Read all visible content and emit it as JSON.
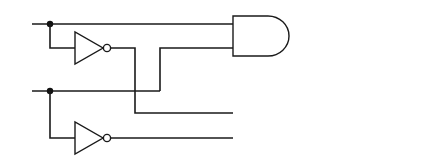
{
  "diagram": {
    "type": "logic-circuit",
    "inputs": [
      {
        "name": "x",
        "label": "x"
      },
      {
        "name": "y",
        "label": "y"
      }
    ],
    "inverters": [
      {
        "input": "x",
        "output_label": "x′"
      },
      {
        "input": "y",
        "output_label": "y′"
      }
    ],
    "and_gates": [
      {
        "inputs": [
          "x",
          "y"
        ],
        "input_labels": [
          "x",
          "y"
        ],
        "output_label": "x ∧ y"
      },
      {
        "inputs": [
          "x′",
          "y′"
        ],
        "output_label": "x′∧ y′"
      }
    ],
    "or_gate": {
      "inputs": [
        "x ∧ y",
        "x′∧ y′"
      ],
      "output_label": "(x ∧ y) ∨ (x′∧ y′)"
    }
  },
  "colors": {
    "line": "#1a1a1a",
    "background": "#ffffff"
  }
}
